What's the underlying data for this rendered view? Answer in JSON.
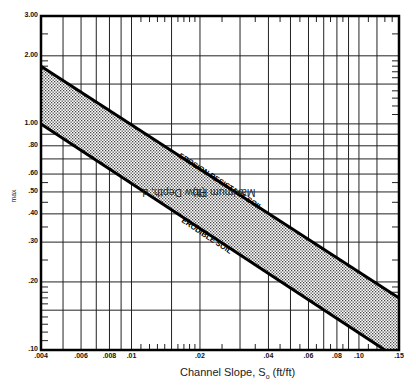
{
  "chart_data": {
    "type": "area",
    "title": "",
    "xlabel": "Channel Slope, S_o (ft/ft)",
    "ylabel": "Maximum Flow Depth, d_max (ft)",
    "xscale": "log",
    "yscale": "log",
    "xlim": [
      0.004,
      0.15
    ],
    "ylim": [
      0.1,
      3.0
    ],
    "grid": true,
    "legend": "none",
    "x_tick_labels": [
      ".004",
      ".006",
      ".008",
      ".01",
      ".02",
      ".04",
      ".06",
      ".08",
      ".10",
      ".15"
    ],
    "x_ticks": [
      0.004,
      0.006,
      0.008,
      0.01,
      0.02,
      0.04,
      0.06,
      0.08,
      0.1,
      0.15
    ],
    "y_tick_labels": [
      "3.00",
      "2.00",
      "1.00",
      ".80",
      ".60",
      ".50",
      ".40",
      ".30",
      ".20",
      ".10"
    ],
    "y_ticks": [
      3.0,
      2.0,
      1.0,
      0.8,
      0.6,
      0.5,
      0.4,
      0.3,
      0.2,
      0.1
    ],
    "series": [
      {
        "name": "Erosion Resistant Soil",
        "x": [
          0.004,
          0.15
        ],
        "y": [
          1.8,
          0.17
        ]
      },
      {
        "name": "Erodible Soil",
        "x": [
          0.004,
          0.13
        ],
        "y": [
          1.0,
          0.1
        ]
      }
    ],
    "shaded_region": "Between Erodible Soil and Erosion Resistant Soil lines (stippled)",
    "annotations": [
      {
        "text": "EROSION RESISTANT SOIL",
        "along": "upper line"
      },
      {
        "text": "ERODIBLE SOIL",
        "along": "lower line"
      }
    ]
  },
  "labels": {
    "ylabel_main": "Maximum Flow Depth, d",
    "ylabel_sub": "max",
    "ylabel_unit": " (ft)",
    "xlabel_main": "Channel Slope, S",
    "xlabel_sub": "o",
    "xlabel_unit": " (ft/ft)",
    "upper_annotation": "EROSION RESISTANT SOIL",
    "lower_annotation": "ERODIBLE SOIL"
  }
}
